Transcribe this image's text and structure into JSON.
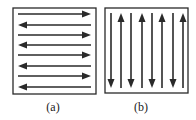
{
  "colors": {
    "stroke": "#2a2a2a",
    "background": "#ffffff"
  },
  "panels": [
    {
      "id": "a",
      "caption": "(a)",
      "orientation": "horizontal",
      "box": {
        "x": 13,
        "y": 8,
        "w": 83,
        "h": 86
      },
      "arrows": [
        {
          "dir": "right",
          "pos": 14
        },
        {
          "dir": "left",
          "pos": 25
        },
        {
          "dir": "right",
          "pos": 35
        },
        {
          "dir": "left",
          "pos": 45
        },
        {
          "dir": "right",
          "pos": 55
        },
        {
          "dir": "left",
          "pos": 66
        },
        {
          "dir": "right",
          "pos": 76
        },
        {
          "dir": "left",
          "pos": 87
        }
      ]
    },
    {
      "id": "b",
      "caption": "(b)",
      "orientation": "vertical",
      "box": {
        "x": 105,
        "y": 8,
        "w": 83,
        "h": 85
      },
      "arrows": [
        {
          "dir": "down",
          "pos": 111
        },
        {
          "dir": "up",
          "pos": 121
        },
        {
          "dir": "down",
          "pos": 131
        },
        {
          "dir": "up",
          "pos": 142
        },
        {
          "dir": "down",
          "pos": 152
        },
        {
          "dir": "up",
          "pos": 162
        },
        {
          "dir": "down",
          "pos": 173
        },
        {
          "dir": "up",
          "pos": 183
        }
      ]
    }
  ]
}
